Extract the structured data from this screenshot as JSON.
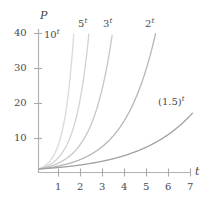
{
  "chart_data": {
    "type": "line",
    "title": "",
    "xlabel": "t",
    "ylabel": "P",
    "xlim": [
      0,
      7.6
    ],
    "ylim": [
      0,
      43
    ],
    "grid": false,
    "legend": "inline-curve-labels",
    "xticks": [
      1,
      2,
      3,
      4,
      5,
      6,
      7
    ],
    "xtick_labels": [
      "1",
      "2",
      "3",
      "4",
      "5",
      "6",
      "7"
    ],
    "yticks": [
      10,
      20,
      30,
      40
    ],
    "ytick_labels": [
      "10",
      "20",
      "30",
      "40"
    ],
    "series": [
      {
        "name": "10^t",
        "base": 10,
        "label_base": "10",
        "label_exponent": "t",
        "color": "#d9d9d9",
        "x": [
          0,
          0.25,
          0.5,
          0.75,
          1,
          1.25,
          1.5,
          1.6
        ],
        "values": [
          1,
          1.78,
          3.16,
          5.62,
          10,
          17.78,
          31.62,
          39.81
        ]
      },
      {
        "name": "5^t",
        "base": 5,
        "label_base": "5",
        "label_exponent": "t",
        "color": "#d2d2d2",
        "x": [
          0,
          0.5,
          1,
          1.5,
          2,
          2.25,
          2.29
        ],
        "values": [
          1,
          2.24,
          5,
          11.18,
          25,
          37.28,
          40.0
        ]
      },
      {
        "name": "3^t",
        "base": 3,
        "label_base": "3",
        "label_exponent": "t",
        "color": "#c6c6c6",
        "x": [
          0,
          0.5,
          1,
          1.5,
          2,
          2.5,
          3,
          3.36
        ],
        "values": [
          1,
          1.73,
          3,
          5.2,
          9,
          15.59,
          27,
          40.0
        ]
      },
      {
        "name": "2^t",
        "base": 2,
        "label_base": "2",
        "label_exponent": "t",
        "color": "#b6b6b6",
        "x": [
          0,
          1,
          2,
          3,
          4,
          4.5,
          5,
          5.32
        ],
        "values": [
          1,
          2,
          4,
          8,
          16,
          22.63,
          32,
          40.0
        ]
      },
      {
        "name": "(1.5)^t",
        "base": 1.5,
        "label_base": "(1.5)",
        "label_exponent": "t",
        "color": "#a0a0a0",
        "x": [
          0,
          1,
          2,
          3,
          4,
          5,
          6,
          7
        ],
        "values": [
          1,
          1.5,
          2.25,
          3.38,
          5.06,
          7.59,
          11.39,
          17.09
        ]
      }
    ]
  },
  "axes": {
    "y_axis_label": "P",
    "x_axis_label": "t",
    "axis_color": "#b0b0b0",
    "tick_color": "#a8a8a8"
  },
  "ytick_labels": {
    "t40": "40",
    "t30": "30",
    "t20": "20",
    "t10": "10"
  },
  "xtick_labels": {
    "t1": "1",
    "t2": "2",
    "t3": "3",
    "t4": "4",
    "t5": "5",
    "t6": "6",
    "t7": "7"
  },
  "curve_labels": {
    "c10_base": "10",
    "c10_exp": "t",
    "c5_base": "5",
    "c5_exp": "t",
    "c3_base": "3",
    "c3_exp": "t",
    "c2_base": "2",
    "c2_exp": "t",
    "c15_base": "(1.5)",
    "c15_exp": "t"
  }
}
